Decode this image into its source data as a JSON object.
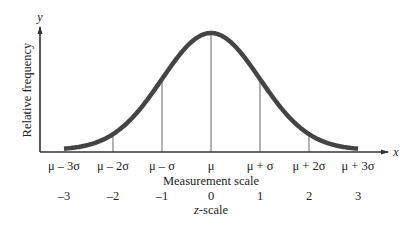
{
  "chart_data": {
    "type": "line",
    "title": "",
    "xlabel": "Measurement scale",
    "ylabel": "Relative frequency",
    "x_axis_symbol": "x",
    "y_axis_symbol": "y",
    "secondary_xlabel": "z-scale",
    "tick_labels": [
      "μ – 3σ",
      "μ – 2σ",
      "μ – σ",
      "μ",
      "μ + σ",
      "μ + 2σ",
      "μ + 3σ"
    ],
    "z_values": [
      "–3",
      "–2",
      "–1",
      "0",
      "1",
      "2",
      "3"
    ],
    "z_numeric": [
      -3,
      -2,
      -1,
      0,
      1,
      2,
      3
    ],
    "vertical_reference_lines_at_z": [
      -2,
      -1,
      0,
      1,
      2
    ],
    "curve": {
      "distribution": "normal",
      "mean": 0,
      "sd": 1,
      "x_range": [
        -3,
        3
      ],
      "relative_heights": [
        0.011,
        0.135,
        0.607,
        1.0,
        0.607,
        0.135,
        0.011
      ]
    },
    "grid": false,
    "legend": null
  },
  "colors": {
    "curve": "#444444",
    "axis": "#333333",
    "reference_line": "#666666",
    "text": "#222222"
  }
}
